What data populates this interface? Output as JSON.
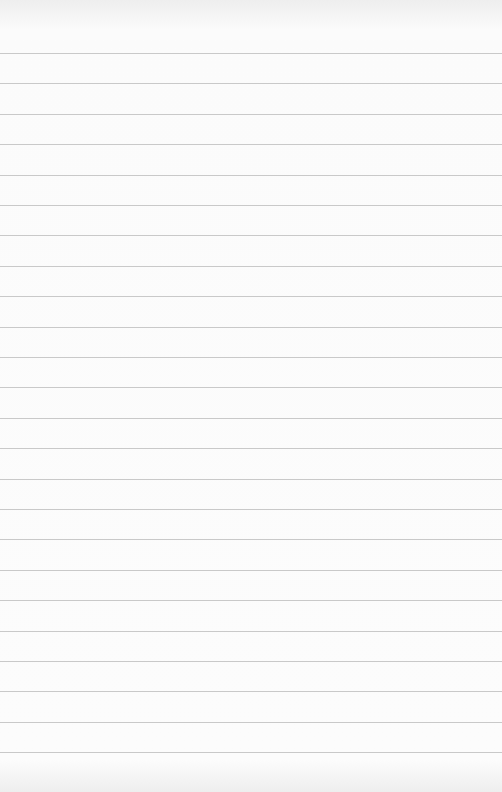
{
  "paper": {
    "type": "lined-paper",
    "background_color": "#fbfbfb",
    "line_color": "#c9c9c9",
    "first_line_y": 53,
    "line_spacing": 30.4,
    "line_count": 24
  }
}
